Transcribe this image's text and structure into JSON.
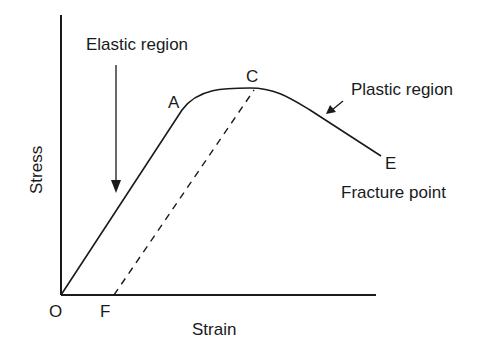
{
  "diagram": {
    "type": "stress-strain curve",
    "axes": {
      "y_label": "Stress",
      "x_label": "Strain"
    },
    "points": {
      "origin": "O",
      "permanent_set": "F",
      "elastic_limit": "A",
      "ultimate_point": "C",
      "fracture": "E"
    },
    "annotations": {
      "elastic_region": "Elastic region",
      "plastic_region": "Plastic region",
      "fracture_point": "Fracture point"
    },
    "colors": {
      "line": "#1a1a1a",
      "background": "#ffffff"
    }
  }
}
